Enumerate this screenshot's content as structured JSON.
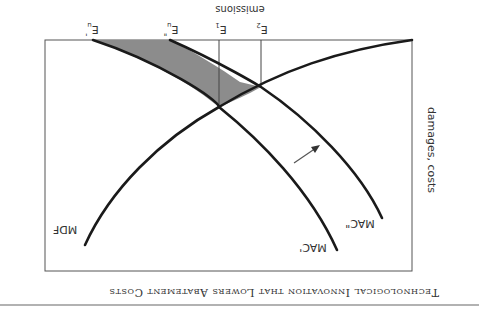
{
  "figure": {
    "title": "Technological Innovation that Lowers Abatement Costs",
    "orientation": "rotated 180°",
    "x_axis_label": "emissions",
    "y_axis_label": "damages, costs",
    "curves": [
      {
        "id": "mdf",
        "label": "MDF"
      },
      {
        "id": "mac1",
        "label": "MAC'"
      },
      {
        "id": "mac2",
        "label": "MAC\""
      }
    ],
    "emission_levels": [
      {
        "id": "eu1",
        "label": "E",
        "sub": "u",
        "sup": "'"
      },
      {
        "id": "eu2",
        "label": "E",
        "sub": "u",
        "sup": "\""
      },
      {
        "id": "e1",
        "label": "E",
        "sub": "1",
        "sup": ""
      },
      {
        "id": "e2",
        "label": "E",
        "sub": "2",
        "sup": ""
      }
    ],
    "shaded_region": "area between MAC' and MAC\" above MDF, from E1/E2 to Eu'/Eu\"",
    "arrow": "shift of MAC' outward to MAC\"",
    "colors": {
      "curve": "#1a1a1a",
      "shade": "#8c8c8c",
      "frame": "#555555",
      "background": "#ffffff"
    }
  }
}
